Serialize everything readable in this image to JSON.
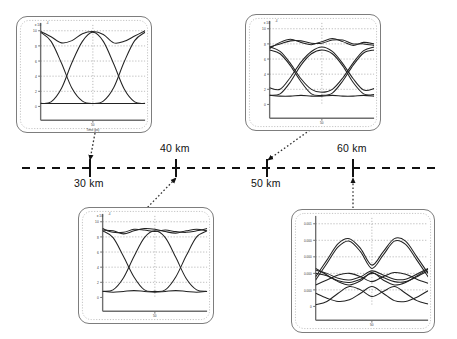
{
  "figure": {
    "kind": "eye-diagram-evolution",
    "background": "#ffffff",
    "line_color": "#222222",
    "grid_color": "#9a9a9a",
    "panel_border_color": "#7d7d7d"
  },
  "axis": {
    "name": "distance-axis",
    "style": "dashed",
    "color": "#111111",
    "x_start": 22,
    "x_end": 441,
    "y": 168,
    "ticks": [
      {
        "label": "30 km",
        "x": 90,
        "label_x": 74,
        "label_y": 178,
        "label_pos": "below"
      },
      {
        "label": "40 km",
        "x": 176,
        "label_x": 160,
        "label_y": 143,
        "label_pos": "above"
      },
      {
        "label": "50 km",
        "x": 267,
        "label_x": 251,
        "label_y": 178,
        "label_pos": "below"
      },
      {
        "label": "60 km",
        "x": 353,
        "label_x": 337,
        "label_y": 143,
        "label_pos": "above"
      }
    ]
  },
  "connectors": [
    {
      "name": "connector-30km",
      "from_x": 95,
      "from_y": 133,
      "to_x": 90,
      "to_y": 160,
      "arrow_at": "end"
    },
    {
      "name": "connector-40km",
      "from_x": 145,
      "from_y": 210,
      "to_x": 176,
      "to_y": 178,
      "arrow_at": "end"
    },
    {
      "name": "connector-50km",
      "from_x": 310,
      "from_y": 130,
      "to_x": 268,
      "to_y": 160,
      "arrow_at": "end"
    },
    {
      "name": "connector-60km",
      "from_x": 353,
      "from_y": 208,
      "to_x": 353,
      "to_y": 178,
      "arrow_at": "end"
    }
  ],
  "panels": [
    {
      "name": "eye-diagram-30km",
      "distance": "30 km",
      "rect": {
        "x": 16,
        "y": 16,
        "w": 136,
        "h": 117
      },
      "xlabel": "Time (ps)",
      "y_exp": "x 10",
      "y_exp_sup": "-4",
      "x_tick": "50",
      "y_ticks": [
        "10",
        "8",
        "6",
        "4",
        "2",
        "0"
      ],
      "traces": 3,
      "eye_openness": "open"
    },
    {
      "name": "eye-diagram-40km",
      "distance": "40 km",
      "rect": {
        "x": 78,
        "y": 207,
        "w": 136,
        "h": 117
      },
      "xlabel": "Time (ps)",
      "y_exp": "x 10",
      "y_exp_sup": "-4",
      "x_tick": "50",
      "y_ticks": [
        "10",
        "8",
        "6",
        "4",
        "2",
        "0"
      ],
      "traces": 4,
      "eye_openness": "slightly-degraded"
    },
    {
      "name": "eye-diagram-50km",
      "distance": "50 km",
      "rect": {
        "x": 245,
        "y": 14,
        "w": 136,
        "h": 117
      },
      "xlabel": "Time (ps)",
      "y_exp": "x 10",
      "y_exp_sup": "-4",
      "x_tick": "50",
      "y_ticks": [
        "10",
        "8",
        "6",
        "4",
        "2",
        "0"
      ],
      "traces": 6,
      "eye_openness": "degraded"
    },
    {
      "name": "eye-diagram-60km",
      "distance": "60 km",
      "rect": {
        "x": 291,
        "y": 209,
        "w": 144,
        "h": 124
      },
      "xlabel": "Time (ps)",
      "y_exp": "",
      "y_exp_sup": "",
      "x_tick": "50",
      "y_ticks": [
        "0.001",
        "0.000",
        "0.000",
        "0.000",
        "0.000",
        "0"
      ],
      "traces": 8,
      "eye_openness": "closed"
    }
  ],
  "chart_data": {
    "type": "line",
    "title": "",
    "xlabel": "Time (ps)",
    "ylabel": "Optical power (a.u.)",
    "panels": [
      {
        "name": "30 km",
        "x": [
          0,
          10,
          20,
          30,
          40,
          50,
          60,
          70,
          80,
          90,
          100
        ],
        "xlim": [
          0,
          100
        ],
        "ylim": [
          0,
          10
        ],
        "y_tick_values": [
          0,
          2,
          4,
          6,
          8,
          10
        ],
        "x_tick_values": [
          50
        ],
        "y_scale_exponent": -4,
        "eye_opening_rel": 1.0,
        "series": [
          {
            "name": "trace-upper-1",
            "values": [
              9.9,
              9.2,
              8.4,
              8.7,
              9.6,
              9.9,
              9.5,
              8.4,
              8.6,
              9.3,
              10.0
            ]
          },
          {
            "name": "trace-rise",
            "values": [
              0.4,
              0.6,
              2.4,
              5.8,
              8.6,
              9.8,
              8.6,
              5.6,
              2.3,
              0.6,
              0.4
            ]
          },
          {
            "name": "trace-fall",
            "values": [
              9.8,
              8.6,
              5.7,
              2.4,
              0.7,
              0.4,
              0.7,
              2.5,
              5.9,
              8.7,
              9.8
            ]
          },
          {
            "name": "trace-baseline",
            "values": [
              0.4,
              0.4,
              0.4,
              0.4,
              0.4,
              0.4,
              0.4,
              0.4,
              0.4,
              0.4,
              0.4
            ]
          }
        ]
      },
      {
        "name": "40 km",
        "x": [
          0,
          10,
          20,
          30,
          40,
          50,
          60,
          70,
          80,
          90,
          100
        ],
        "xlim": [
          0,
          100
        ],
        "ylim": [
          0,
          10
        ],
        "y_tick_values": [
          0,
          2,
          4,
          6,
          8,
          10
        ],
        "x_tick_values": [
          50
        ],
        "y_scale_exponent": -4,
        "eye_opening_rel": 0.82,
        "series": [
          {
            "name": "trace-upper-1",
            "values": [
              8.9,
              8.8,
              8.4,
              8.8,
              9.1,
              9.0,
              8.7,
              8.5,
              8.8,
              9.0,
              8.8
            ]
          },
          {
            "name": "trace-upper-2",
            "values": [
              9.1,
              8.6,
              8.6,
              9.0,
              8.9,
              8.7,
              8.9,
              8.7,
              8.6,
              8.8,
              9.1
            ]
          },
          {
            "name": "trace-rise",
            "values": [
              0.8,
              1.0,
              2.6,
              5.4,
              7.9,
              8.8,
              7.9,
              5.3,
              2.5,
              1.0,
              0.8
            ]
          },
          {
            "name": "trace-fall",
            "values": [
              8.8,
              7.9,
              5.4,
              2.7,
              1.0,
              0.8,
              1.0,
              2.7,
              5.5,
              8.0,
              8.8
            ]
          },
          {
            "name": "trace-baseline",
            "values": [
              0.8,
              0.7,
              0.8,
              0.9,
              0.8,
              0.7,
              0.8,
              0.9,
              0.8,
              0.7,
              0.8
            ]
          }
        ]
      },
      {
        "name": "50 km",
        "x": [
          0,
          10,
          20,
          30,
          40,
          50,
          60,
          70,
          80,
          90,
          100
        ],
        "xlim": [
          0,
          100
        ],
        "ylim": [
          0,
          10
        ],
        "y_tick_values": [
          0,
          2,
          4,
          6,
          8,
          10
        ],
        "x_tick_values": [
          50
        ],
        "y_scale_exponent": -4,
        "eye_opening_rel": 0.55,
        "series": [
          {
            "name": "trace-upper-1",
            "values": [
              7.4,
              8.2,
              8.6,
              8.2,
              7.9,
              8.3,
              8.7,
              8.3,
              7.8,
              8.2,
              8.0
            ]
          },
          {
            "name": "trace-upper-2",
            "values": [
              7.6,
              8.0,
              8.4,
              8.4,
              8.1,
              8.1,
              8.5,
              8.5,
              8.0,
              8.0,
              7.8
            ]
          },
          {
            "name": "trace-rise-1",
            "values": [
              2.2,
              2.0,
              3.6,
              5.6,
              7.0,
              7.6,
              7.0,
              5.4,
              3.4,
              1.9,
              2.1
            ]
          },
          {
            "name": "trace-rise-2",
            "values": [
              1.2,
              1.4,
              3.0,
              5.2,
              6.7,
              7.2,
              6.7,
              5.1,
              2.9,
              1.4,
              1.3
            ]
          },
          {
            "name": "trace-fall-1",
            "values": [
              7.6,
              7.0,
              5.4,
              3.4,
              2.0,
              1.6,
              2.0,
              3.5,
              5.5,
              7.1,
              7.6
            ]
          },
          {
            "name": "trace-fall-2",
            "values": [
              7.2,
              6.7,
              5.1,
              3.0,
              1.4,
              1.2,
              1.5,
              3.1,
              5.2,
              6.8,
              7.2
            ]
          },
          {
            "name": "trace-baseline",
            "values": [
              1.2,
              1.1,
              1.1,
              1.2,
              1.1,
              1.1,
              1.2,
              1.1,
              1.1,
              1.2,
              1.1
            ]
          }
        ]
      },
      {
        "name": "60 km",
        "x": [
          0,
          10,
          20,
          30,
          40,
          50,
          60,
          70,
          80,
          90,
          100
        ],
        "xlim": [
          0,
          100
        ],
        "ylim": [
          0,
          10
        ],
        "y_tick_values": [
          0,
          2,
          4,
          6,
          8,
          10
        ],
        "x_tick_values": [
          50
        ],
        "y_scale_exponent": -4,
        "eye_opening_rel": 0.22,
        "series": [
          {
            "name": "trace-peak-1",
            "values": [
              3.6,
              5.6,
              7.6,
              8.2,
              7.0,
              5.0,
              6.6,
              8.2,
              7.9,
              6.0,
              4.0
            ]
          },
          {
            "name": "trace-peak-2",
            "values": [
              3.2,
              5.2,
              7.2,
              7.9,
              6.6,
              4.6,
              6.2,
              7.9,
              7.5,
              5.6,
              3.6
            ]
          },
          {
            "name": "trace-mid-1",
            "values": [
              4.4,
              4.0,
              3.4,
              3.2,
              3.6,
              4.3,
              3.8,
              3.3,
              3.3,
              3.9,
              4.6
            ]
          },
          {
            "name": "trace-mid-2",
            "values": [
              4.0,
              3.7,
              3.1,
              2.9,
              3.3,
              4.0,
              3.5,
              3.0,
              3.0,
              3.6,
              4.3
            ]
          },
          {
            "name": "trace-cross-1",
            "values": [
              2.6,
              3.2,
              3.8,
              4.0,
              3.6,
              3.0,
              3.6,
              4.1,
              3.9,
              3.3,
              2.8
            ]
          },
          {
            "name": "trace-cross-2",
            "values": [
              4.6,
              3.8,
              3.0,
              2.6,
              3.1,
              4.1,
              3.2,
              2.6,
              2.9,
              3.7,
              4.5
            ]
          },
          {
            "name": "trace-low-1",
            "values": [
              1.6,
              1.0,
              0.6,
              0.8,
              1.6,
              2.4,
              1.6,
              0.7,
              0.6,
              1.1,
              1.9
            ]
          },
          {
            "name": "trace-low-2",
            "values": [
              0.2,
              0.6,
              1.6,
              2.4,
              2.0,
              1.2,
              1.8,
              2.4,
              1.6,
              0.7,
              0.3
            ]
          }
        ]
      }
    ]
  }
}
